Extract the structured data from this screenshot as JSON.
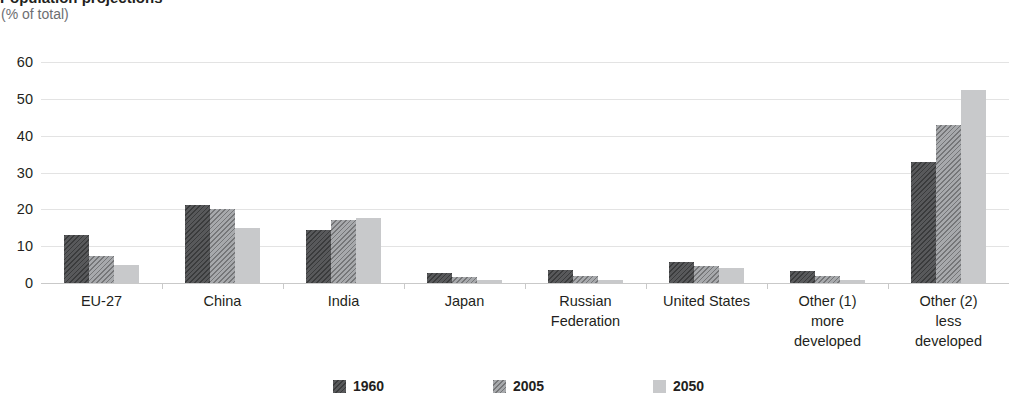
{
  "header": {
    "title": "Population projections",
    "subtitle": "(% of total)"
  },
  "legend": {
    "items": [
      {
        "label": "1960",
        "swatch": "dark-hatched",
        "color": "#58595b"
      },
      {
        "label": "2005",
        "swatch": "medium-hatched",
        "color": "#a7a9ac"
      },
      {
        "label": "2050",
        "swatch": "light-solid",
        "color": "#c8c9cb"
      }
    ]
  },
  "chart_data": {
    "type": "bar",
    "title": "Population projections",
    "subtitle": "(% of total)",
    "xlabel": "",
    "ylabel": "",
    "ylim": [
      0,
      60
    ],
    "yticks": [
      0,
      10,
      20,
      30,
      40,
      50,
      60
    ],
    "ytick_labels": [
      "0",
      "10",
      "20",
      "30",
      "40",
      "50",
      "60"
    ],
    "grid": true,
    "legend_position": "bottom",
    "categories": [
      "EU-27",
      "China",
      "India",
      "Japan",
      "Russian Federation",
      "United States",
      "Other (1) more developed",
      "Other (2) less developed"
    ],
    "category_lines": [
      [
        "EU-27"
      ],
      [
        "China"
      ],
      [
        "India"
      ],
      [
        "Japan"
      ],
      [
        "Russian",
        "Federation"
      ],
      [
        "United States"
      ],
      [
        "Other (1)",
        "more",
        "developed"
      ],
      [
        "Other (2)",
        "less",
        "developed"
      ]
    ],
    "series": [
      {
        "name": "1960",
        "color": "#58595b",
        "values": [
          13.0,
          21.3,
          14.3,
          2.7,
          3.4,
          5.7,
          3.2,
          32.8
        ]
      },
      {
        "name": "2005",
        "color": "#a7a9ac",
        "values": [
          7.2,
          20.0,
          17.0,
          1.6,
          1.9,
          4.6,
          1.8,
          43.0
        ]
      },
      {
        "name": "2050",
        "color": "#c8c9cb",
        "values": [
          5.0,
          15.0,
          17.6,
          0.8,
          0.9,
          4.0,
          0.8,
          52.5
        ]
      }
    ]
  }
}
